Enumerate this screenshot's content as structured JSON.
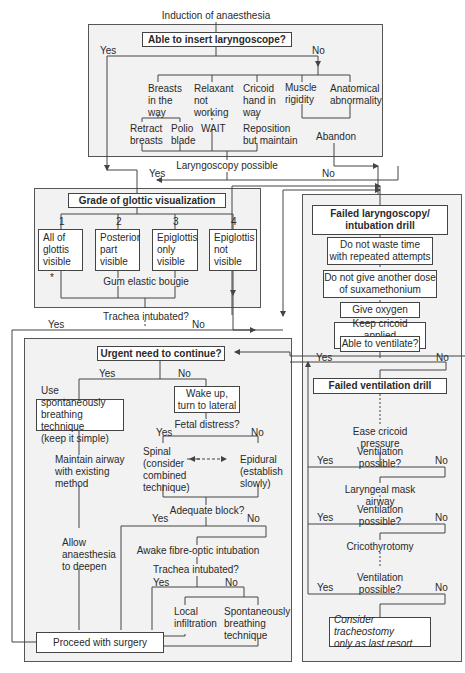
{
  "diagram": {
    "start_label": "Induction of anaesthesia",
    "section1": {
      "question": "Able to insert laryngoscope?",
      "yes": "Yes",
      "no": "No",
      "causes": [
        "Breasts\nin the\nway",
        "Relaxant\nnot\nworking",
        "Cricoid\nhand in\nway",
        "Muscle\nrigidity",
        "Anatomical\nabnormality"
      ],
      "actions": [
        "Retract\nbreasts",
        "Polio\nblade",
        "WAIT",
        "Reposition\nbut maintain",
        "Abandon"
      ],
      "outcome": "Laryngoscopy possible"
    },
    "section2": {
      "yes": "Yes",
      "no": "No",
      "title": "Grade of glottic visualization",
      "grades": [
        {
          "num": "1",
          "label": "All of\nglottis\nvisible"
        },
        {
          "num": "2",
          "label": "Posterior\npart\nvisible"
        },
        {
          "num": "3",
          "label": "Epiglottis\nonly\nvisible"
        },
        {
          "num": "4",
          "label": "Epiglottis\nnot\nvisible"
        }
      ],
      "bougie": "Gum elastic bougie",
      "asterisk": "*",
      "question": "Trachea intubated?",
      "q_yes": "Yes",
      "q_no": "No"
    },
    "section3": {
      "question": "Urgent need to continue?",
      "yes": "Yes",
      "no": "No",
      "spont": "Use spontaneously\nbreathing technique\n(keep it simple)",
      "maintain": "Maintain airway\nwith existing\nmethod",
      "allow": "Allow\nanaesthesia\nto deepen",
      "wake": "Wake up,\nturn to lateral",
      "fetal": "Fetal distress?",
      "fetal_yes": "Yes",
      "fetal_no": "No",
      "spinal": "Spinal\n(consider\ncombined\ntechnique)",
      "epidural": "Epidural\n(establish\nslowly)",
      "adequate": "Adequate block?",
      "adequate_yes": "Yes",
      "adequate_no": "No",
      "awake": "Awake fibre-optic intubation",
      "trachea": "Trachea intubated?",
      "trachea_yes": "Yes",
      "trachea_no": "No",
      "local": "Local\ninfiltration",
      "spont2": "Spontaneously\nbreathing\ntechnique",
      "proceed": "Proceed with surgery"
    },
    "section4": {
      "title": "Failed laryngoscopy/\nintubation drill",
      "steps": [
        "Do not waste time\nwith repeated attempts",
        "Do not give another dose\nof suxamethonium",
        "Give oxygen",
        "Keep cricoid applied\nDo not turn"
      ],
      "ventilate_q": "Able to ventilate?",
      "yes": "Yes",
      "no": "No"
    },
    "section5": {
      "title": "Failed ventilation drill",
      "ease": "Ease cricoid pressure",
      "q1": "Ventilation possible?",
      "lma": "Laryngeal mask airway",
      "q2": "Ventilation possible?",
      "crico": "Cricothyrotomy",
      "q3": "Ventilation possible?",
      "yes": "Yes",
      "no": "No",
      "final": "Consider tracheostomy\nonly as last resort"
    },
    "colors": {
      "panel_bg": "#f2f2f2",
      "box_bg": "#ffffff",
      "line": "#444444",
      "text": "#2a2a2a"
    }
  }
}
